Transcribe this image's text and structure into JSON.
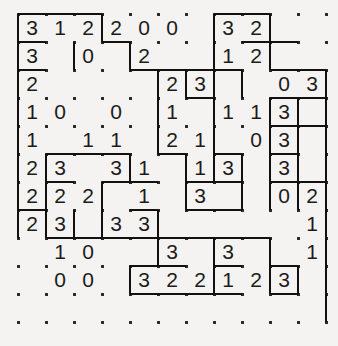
{
  "puzzle": {
    "name": "region-division-number-grid",
    "type": "grid-puzzle",
    "rows": 11,
    "cols": 11,
    "cell_size": 28,
    "origin_x": 18,
    "origin_y": 14,
    "ink_color": "#111111",
    "dot_color": "#2a2a2a",
    "background_color": "#f4f3f1",
    "text_color": "#1b1b1b",
    "cells": [
      [
        "3",
        "1",
        "2",
        "2",
        "0",
        "0",
        "",
        "3",
        "2",
        "",
        ""
      ],
      [
        "3",
        "",
        "0",
        "",
        "2",
        "",
        "",
        "1",
        "2",
        "",
        ""
      ],
      [
        "2",
        "",
        "",
        "",
        "",
        "2",
        "3",
        "",
        "",
        "0",
        "3"
      ],
      [
        "1",
        "0",
        "",
        "0",
        "",
        "1",
        "",
        "1",
        "1",
        "3",
        ""
      ],
      [
        "1",
        "",
        "1",
        "1",
        "",
        "2",
        "1",
        "",
        "0",
        "3",
        ""
      ],
      [
        "2",
        "3",
        "",
        "3",
        "1",
        "",
        "1",
        "3",
        "",
        "3",
        ""
      ],
      [
        "2",
        "2",
        "2",
        "",
        "1",
        "",
        "3",
        "",
        "",
        "0",
        "2"
      ],
      [
        "2",
        "3",
        "",
        "3",
        "3",
        "",
        "",
        "",
        "",
        "",
        "1"
      ],
      [
        "",
        "1",
        "0",
        "",
        "",
        "3",
        "",
        "3",
        "",
        "",
        "1"
      ],
      [
        "",
        "0",
        "0",
        "",
        "3",
        "2",
        "2",
        "1",
        "2",
        "3",
        ""
      ],
      [
        "",
        "",
        "",
        "",
        "",
        "",
        "",
        "",
        "",
        "",
        ""
      ]
    ],
    "dots": {
      "visible": true,
      "note": "lattice point markers at cell corners"
    },
    "borders": {
      "horizontal": [
        {
          "row": 0,
          "col": 0,
          "len": 3
        },
        {
          "row": 0,
          "col": 7,
          "len": 2
        },
        {
          "row": 1,
          "col": 0,
          "len": 1
        },
        {
          "row": 1,
          "col": 3,
          "len": 1
        },
        {
          "row": 1,
          "col": 8,
          "len": 2
        },
        {
          "row": 2,
          "col": 0,
          "len": 1
        },
        {
          "row": 2,
          "col": 4,
          "len": 2
        },
        {
          "row": 2,
          "col": 6,
          "len": 2
        },
        {
          "row": 2,
          "col": 9,
          "len": 2
        },
        {
          "row": 3,
          "col": 6,
          "len": 1
        },
        {
          "row": 3,
          "col": 9,
          "len": 2
        },
        {
          "row": 4,
          "col": 9,
          "len": 1
        },
        {
          "row": 4,
          "col": 10,
          "len": 1
        },
        {
          "row": 5,
          "col": 1,
          "len": 3
        },
        {
          "row": 5,
          "col": 5,
          "len": 1
        },
        {
          "row": 5,
          "col": 7,
          "len": 1
        },
        {
          "row": 5,
          "col": 9,
          "len": 1
        },
        {
          "row": 6,
          "col": 1,
          "len": 1
        },
        {
          "row": 6,
          "col": 3,
          "len": 2
        },
        {
          "row": 6,
          "col": 6,
          "len": 2
        },
        {
          "row": 6,
          "col": 9,
          "len": 2
        },
        {
          "row": 7,
          "col": 0,
          "len": 1
        },
        {
          "row": 7,
          "col": 4,
          "len": 1
        },
        {
          "row": 7,
          "col": 6,
          "len": 2
        },
        {
          "row": 8,
          "col": 1,
          "len": 2
        },
        {
          "row": 8,
          "col": 3,
          "len": 2
        },
        {
          "row": 8,
          "col": 5,
          "len": 2
        },
        {
          "row": 8,
          "col": 7,
          "len": 2
        },
        {
          "row": 9,
          "col": 4,
          "len": 2
        },
        {
          "row": 9,
          "col": 7,
          "len": 1
        },
        {
          "row": 9,
          "col": 9,
          "len": 1
        },
        {
          "row": 10,
          "col": 4,
          "len": 4
        },
        {
          "row": 10,
          "col": 9,
          "len": 1
        }
      ],
      "vertical": [
        {
          "row": 0,
          "col": 0,
          "len": 2
        },
        {
          "row": 0,
          "col": 3,
          "len": 1
        },
        {
          "row": 0,
          "col": 7,
          "len": 1
        },
        {
          "row": 0,
          "col": 9,
          "len": 1
        },
        {
          "row": 1,
          "col": 2,
          "len": 1
        },
        {
          "row": 1,
          "col": 4,
          "len": 1
        },
        {
          "row": 1,
          "col": 7,
          "len": 2
        },
        {
          "row": 1,
          "col": 9,
          "len": 1
        },
        {
          "row": 2,
          "col": 0,
          "len": 6
        },
        {
          "row": 2,
          "col": 5,
          "len": 3
        },
        {
          "row": 2,
          "col": 6,
          "len": 1
        },
        {
          "row": 2,
          "col": 8,
          "len": 1
        },
        {
          "row": 2,
          "col": 11,
          "len": 5
        },
        {
          "row": 3,
          "col": 7,
          "len": 3
        },
        {
          "row": 3,
          "col": 9,
          "len": 1
        },
        {
          "row": 3,
          "col": 10,
          "len": 2
        },
        {
          "row": 4,
          "col": 5,
          "len": 1
        },
        {
          "row": 4,
          "col": 9,
          "len": 1
        },
        {
          "row": 5,
          "col": 1,
          "len": 3
        },
        {
          "row": 5,
          "col": 4,
          "len": 1
        },
        {
          "row": 5,
          "col": 6,
          "len": 2
        },
        {
          "row": 5,
          "col": 8,
          "len": 2
        },
        {
          "row": 5,
          "col": 9,
          "len": 2
        },
        {
          "row": 5,
          "col": 10,
          "len": 2
        },
        {
          "row": 6,
          "col": 3,
          "len": 1
        },
        {
          "row": 6,
          "col": 6,
          "len": 1
        },
        {
          "row": 6,
          "col": 11,
          "len": 1
        },
        {
          "row": 7,
          "col": 0,
          "len": 1
        },
        {
          "row": 7,
          "col": 2,
          "len": 1
        },
        {
          "row": 7,
          "col": 3,
          "len": 1
        },
        {
          "row": 7,
          "col": 5,
          "len": 1
        },
        {
          "row": 7,
          "col": 11,
          "len": 4
        },
        {
          "row": 8,
          "col": 5,
          "len": 1
        },
        {
          "row": 8,
          "col": 7,
          "len": 1
        },
        {
          "row": 8,
          "col": 9,
          "len": 1
        },
        {
          "row": 9,
          "col": 4,
          "len": 1
        },
        {
          "row": 9,
          "col": 7,
          "len": 1
        },
        {
          "row": 9,
          "col": 9,
          "len": 1
        },
        {
          "row": 9,
          "col": 10,
          "len": 1
        }
      ]
    }
  }
}
